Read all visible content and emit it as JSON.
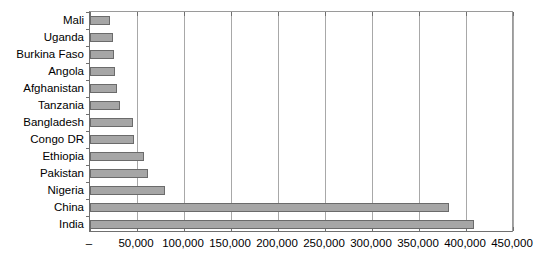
{
  "chart_data": {
    "type": "bar",
    "orientation": "horizontal",
    "title": "",
    "subtitle": "",
    "xlabel": "",
    "ylabel": "",
    "categories": [
      "Mali",
      "Uganda",
      "Burkina Faso",
      "Angola",
      "Afghanistan",
      "Tanzania",
      "Bangladesh",
      "Congo DR",
      "Ethiopia",
      "Pakistan",
      "Nigeria",
      "China",
      "India"
    ],
    "values": [
      21000,
      24000,
      26000,
      27000,
      29000,
      32000,
      46000,
      47000,
      57000,
      62000,
      80000,
      382000,
      409000
    ],
    "xlim": [
      0,
      450000
    ],
    "xticks": [
      0,
      50000,
      100000,
      150000,
      200000,
      250000,
      300000,
      350000,
      400000,
      450000
    ],
    "xtick_labels": [
      "–",
      "50,000",
      "100,000",
      "150,000",
      "200,000",
      "250,000",
      "300,000",
      "350,000",
      "400,000",
      "450,000"
    ],
    "grid": true,
    "grid_axis": "x",
    "legend": false,
    "legend_position": "none",
    "bar_color": "#a6a6a6",
    "bar_border_color": "#6b6b6b",
    "axis_color": "#6f6f6f",
    "gridline_color": "#a8a8a8",
    "background_color": "#ffffff"
  }
}
